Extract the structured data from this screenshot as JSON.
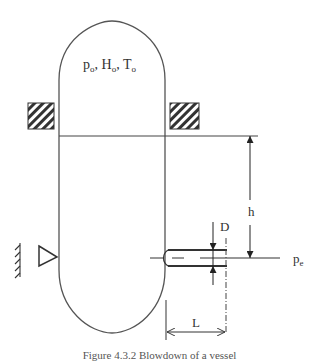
{
  "diagram": {
    "vessel_label": {
      "p": "p",
      "p_sub": "o",
      "sep1": ", ",
      "H": "H",
      "H_sub": "o",
      "sep2": ", ",
      "T": "T",
      "T_sub": "o"
    },
    "dimension_labels": {
      "height": "h",
      "diameter": "D",
      "length": "L",
      "exit_pressure": "p",
      "exit_pressure_sub": "e"
    },
    "caption": "Figure 4.3.2  Blowdown of a vessel"
  },
  "colors": {
    "line": "#444444",
    "background": "#ffffff"
  }
}
